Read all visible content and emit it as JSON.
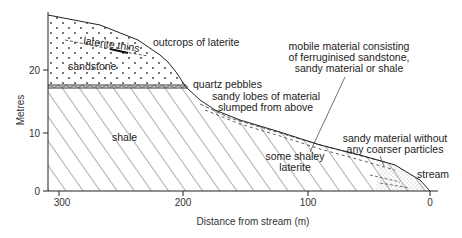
{
  "figure": {
    "type": "geological cross-section",
    "y_axis": {
      "label": "Metres",
      "ticks": [
        {
          "value": 0,
          "label": "0"
        },
        {
          "value": 10,
          "label": "10"
        },
        {
          "value": 20,
          "label": "20"
        }
      ]
    },
    "x_axis": {
      "label": "Distance from stream (m)",
      "ticks": [
        {
          "value": 300,
          "label": "300"
        },
        {
          "value": 200,
          "label": "200"
        },
        {
          "value": 100,
          "label": "100"
        },
        {
          "value": 0,
          "label": "0"
        }
      ]
    },
    "layers": {
      "sandstone": "sandstone",
      "shale": "shale",
      "laterite_thins": "laterite thins"
    },
    "annotations": {
      "outcrops": "outcrops of laterite",
      "quartz": "quartz pebbles",
      "lobes_1": "sandy lobes of material",
      "lobes_2": "slumped from above",
      "mobile_1": "mobile material consisting",
      "mobile_2": "of ferruginised sandstone,",
      "mobile_3": "sandy material or shale",
      "shaley_1": "some shaley",
      "shaley_2": "laterite",
      "sandy_1": "sandy material without",
      "sandy_2": "any coarser particles",
      "stream": "stream"
    },
    "colors": {
      "ink": "#222222",
      "background": "#ffffff"
    }
  }
}
